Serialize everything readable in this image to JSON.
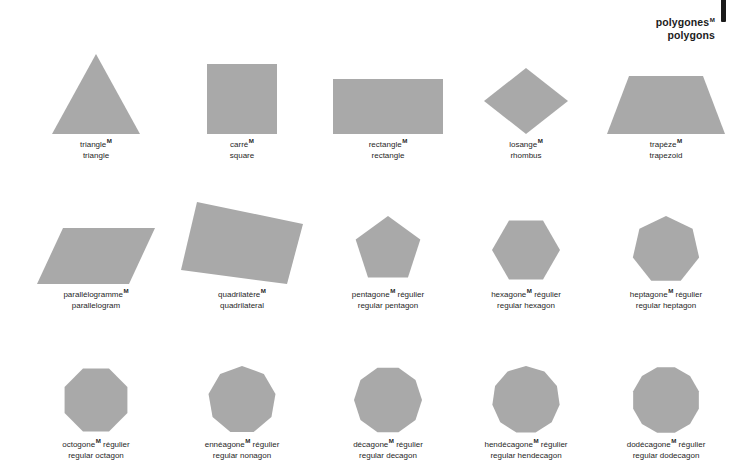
{
  "title": {
    "french": "polygones",
    "french_gender": "M",
    "english": "polygons"
  },
  "colors": {
    "shape_fill": "#a9a9a9",
    "background": "#ffffff",
    "text": "#1f1f1f",
    "edge_tab": "#1a1a1a"
  },
  "rows": [
    {
      "figures": [
        {
          "french": "triangle",
          "gender": "M",
          "french_suffix": "",
          "english": "triangle",
          "sides": 3,
          "shape": "triangle"
        },
        {
          "french": "carré",
          "gender": "M",
          "french_suffix": "",
          "english": "square",
          "sides": 4,
          "shape": "square"
        },
        {
          "french": "rectangle",
          "gender": "M",
          "french_suffix": "",
          "english": "rectangle",
          "sides": 4,
          "shape": "rectangle"
        },
        {
          "french": "losange",
          "gender": "M",
          "french_suffix": "",
          "english": "rhombus",
          "sides": 4,
          "shape": "rhombus"
        },
        {
          "french": "trapèze",
          "gender": "M",
          "french_suffix": "",
          "english": "trapezoid",
          "sides": 4,
          "shape": "trapezoid"
        }
      ]
    },
    {
      "figures": [
        {
          "french": "parallélogramme",
          "gender": "M",
          "french_suffix": "",
          "english": "parallelogram",
          "sides": 4,
          "shape": "parallelogram"
        },
        {
          "french": "quadrilatère",
          "gender": "M",
          "french_suffix": "",
          "english": "quadrilateral",
          "sides": 4,
          "shape": "quadrilateral"
        },
        {
          "french": "pentagone",
          "gender": "M",
          "french_suffix": " régulier",
          "english": "regular pentagon",
          "sides": 5,
          "shape": "regular-polygon"
        },
        {
          "french": "hexagone",
          "gender": "M",
          "french_suffix": " régulier",
          "english": "regular hexagon",
          "sides": 6,
          "shape": "regular-polygon"
        },
        {
          "french": "heptagone",
          "gender": "M",
          "french_suffix": " régulier",
          "english": "regular heptagon",
          "sides": 7,
          "shape": "regular-polygon"
        }
      ]
    },
    {
      "figures": [
        {
          "french": "octogone",
          "gender": "M",
          "french_suffix": " régulier",
          "english": "regular octagon",
          "sides": 8,
          "shape": "regular-polygon"
        },
        {
          "french": "ennéagone",
          "gender": "M",
          "french_suffix": " régulier",
          "english": "regular nonagon",
          "sides": 9,
          "shape": "regular-polygon"
        },
        {
          "french": "décagone",
          "gender": "M",
          "french_suffix": " régulier",
          "english": "regular decagon",
          "sides": 10,
          "shape": "regular-polygon"
        },
        {
          "french": "hendécagone",
          "gender": "M",
          "french_suffix": " régulier",
          "english": "regular hendecagon",
          "sides": 11,
          "shape": "regular-polygon"
        },
        {
          "french": "dodécagone",
          "gender": "M",
          "french_suffix": " régulier",
          "english": "regular dodecagon",
          "sides": 12,
          "shape": "regular-polygon"
        }
      ]
    }
  ]
}
